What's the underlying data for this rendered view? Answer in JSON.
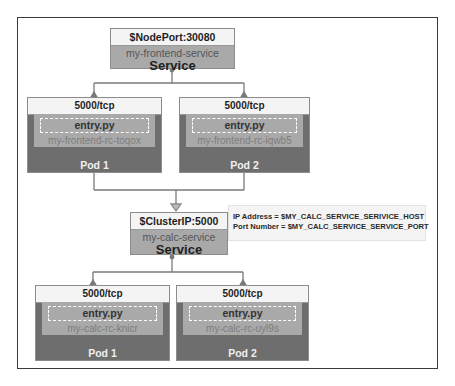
{
  "diagram": {
    "frontend_service": {
      "port_header": "$NodePort:30080",
      "name": "my-frontend-service",
      "kind": "Service"
    },
    "frontend_pods": [
      {
        "port": "5000/tcp",
        "entry": "entry.py",
        "rc": "my-frontend-rc-toqox",
        "label": "Pod 1"
      },
      {
        "port": "5000/tcp",
        "entry": "entry.py",
        "rc": "my-frontend-rc-iqwb5",
        "label": "Pod 2"
      }
    ],
    "calc_service": {
      "port_header": "$ClusterIP:5000",
      "name": "my-calc-service",
      "kind": "Service"
    },
    "env_info": {
      "ip_line": "IP Address = $MY_CALC_SERVICE_SERIVICE_HOST",
      "port_line": "Port Number = $MY_CALC_SERVICE_SERVICE_PORT"
    },
    "calc_pods": [
      {
        "port": "5000/tcp",
        "entry": "entry.py",
        "rc": "my-calc-rc-knicr",
        "label": "Pod 1"
      },
      {
        "port": "5000/tcp",
        "entry": "entry.py",
        "rc": "my-calc-rc-uyl9s",
        "label": "Pod 2"
      }
    ],
    "colors": {
      "header_fill": "#f4f4f4",
      "service_fill": "#a9a9a9",
      "pod_fill": "#6e6e6e",
      "connector": "#7a7a7a"
    }
  }
}
